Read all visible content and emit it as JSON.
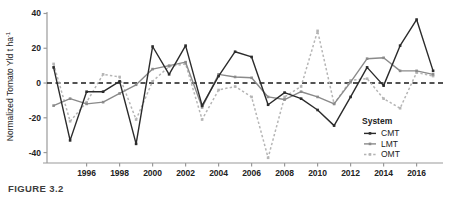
{
  "figure": {
    "caption": "FIGURE 3.2"
  },
  "legend": {
    "title": "System",
    "position": "bottom-right",
    "items": [
      {
        "label": "CMT",
        "color": "#2b2b2b",
        "style": "solid"
      },
      {
        "label": "LMT",
        "color": "#8a8a8a",
        "style": "solid"
      },
      {
        "label": "OMT",
        "color": "#b5b5b5",
        "style": "dotted"
      }
    ]
  },
  "chart_data": {
    "type": "line",
    "title": "",
    "xlabel": "",
    "ylabel": "Normalized Tomato Yld  t ha",
    "ylabel_exponent": "-1",
    "xlim": [
      1993.6,
      2017.6
    ],
    "ylim": [
      -46,
      42
    ],
    "yticks": [
      -40,
      -20,
      0,
      20,
      40
    ],
    "ytick_labels": [
      "-40",
      "-20",
      "0",
      "20",
      "40"
    ],
    "xticks": [
      1996,
      1998,
      2000,
      2002,
      2004,
      2006,
      2008,
      2010,
      2012,
      2014,
      2016
    ],
    "xtick_labels": [
      "1996",
      "1998",
      "2000",
      "2002",
      "2004",
      "2006",
      "2008",
      "2010",
      "2012",
      "2014",
      "2016"
    ],
    "grid": false,
    "reference_line": {
      "y": 0,
      "style": "dashed",
      "color": "#1a1a1a"
    },
    "x": [
      1994,
      1995,
      1996,
      1997,
      1998,
      1999,
      2000,
      2001,
      2002,
      2003,
      2004,
      2005,
      2006,
      2007,
      2008,
      2009,
      2010,
      2011,
      2012,
      2013,
      2014,
      2015,
      2016,
      2017
    ],
    "series": [
      {
        "name": "CMT",
        "color": "#2b2b2b",
        "style": "solid",
        "marker": "square",
        "values": [
          9,
          -33,
          -5,
          -5,
          1,
          -35,
          21,
          5,
          21.5,
          -13,
          4,
          18,
          15,
          -12.5,
          -5.5,
          -9,
          -15.5,
          -24.5,
          -8,
          9,
          -1.5,
          21.5,
          36.5,
          7
        ]
      },
      {
        "name": "LMT",
        "color": "#8a8a8a",
        "style": "solid",
        "marker": "square",
        "values": [
          -13,
          -9,
          -12,
          -11,
          -6,
          -1,
          8,
          10,
          12,
          -14,
          5,
          3.5,
          3,
          -8,
          -9.5,
          -5,
          -8,
          -12,
          0.5,
          14,
          14.5,
          7,
          7,
          5
        ]
      },
      {
        "name": "OMT",
        "color": "#b5b5b5",
        "style": "dotted",
        "marker": "square",
        "values": [
          11,
          -22,
          -11,
          5,
          3.5,
          -21,
          1,
          9.5,
          11,
          -21,
          -4,
          -2,
          -8,
          -43,
          -8,
          -2,
          30,
          -12,
          1.5,
          2.5,
          -9,
          -14.5,
          6,
          4
        ]
      }
    ]
  }
}
